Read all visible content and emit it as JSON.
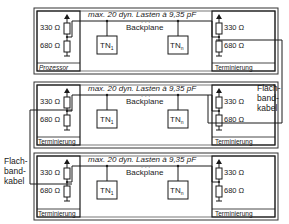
{
  "diagram": {
    "rows": [
      {
        "bus_label": "max. 20 dyn. Lasten à 9,35 pF",
        "backplane_label": "Backplane",
        "left_unit": {
          "label": "Prozessor",
          "r_top": "330 Ω",
          "r_bottom": "680 Ω"
        },
        "right_unit": {
          "label": "Terminierung",
          "r_top": "330 Ω",
          "r_bottom": "680 Ω"
        },
        "nodes": [
          {
            "label": "TN",
            "sub": "1"
          },
          {
            "label": "TN",
            "sub": "n"
          }
        ]
      },
      {
        "bus_label": "max. 20 dyn. Lasten à 9,35 pF",
        "backplane_label": "Backplane",
        "left_unit": {
          "label": "Terminierung",
          "r_top": "330 Ω",
          "r_bottom": "680 Ω"
        },
        "right_unit": {
          "label": "Terminierung",
          "r_top": "330 Ω",
          "r_bottom": "680 Ω"
        },
        "nodes": [
          {
            "label": "TN",
            "sub": "1"
          },
          {
            "label": "TN",
            "sub": "n"
          }
        ]
      },
      {
        "bus_label": "max. 20 dyn. Lasten à 9,35 pF",
        "backplane_label": "Backplane",
        "left_unit": {
          "label": "Terminierung",
          "r_top": "330 Ω",
          "r_bottom": "680 Ω"
        },
        "right_unit": {
          "label": "Terminierung",
          "r_top": "330 Ω",
          "r_bottom": "680 Ω"
        },
        "nodes": [
          {
            "label": "TN",
            "sub": "1"
          },
          {
            "label": "TN",
            "sub": "n"
          }
        ]
      }
    ],
    "cables": [
      {
        "lines": [
          "Flach-",
          "band-",
          "kabel"
        ],
        "side": "right"
      },
      {
        "lines": [
          "Flach-",
          "band-",
          "kabel"
        ],
        "side": "left"
      }
    ]
  }
}
